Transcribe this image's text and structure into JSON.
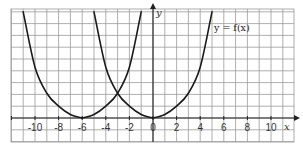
{
  "chart_data": {
    "type": "line",
    "title": "",
    "xlabel": "x",
    "ylabel": "y",
    "xlim": [
      -12,
      12
    ],
    "ylim": [
      -2,
      9.2
    ],
    "grid": true,
    "x_tick_labels": [
      "-10",
      "-8",
      "-6",
      "-4",
      "-2",
      "0",
      "2",
      "4",
      "6",
      "8",
      "10"
    ],
    "annotations": [
      {
        "text": "y = f(x)",
        "x": 5.2,
        "y": 8.2
      }
    ],
    "series": [
      {
        "name": "y = f(x)",
        "x": [
          0,
          1,
          2,
          3,
          4,
          5
        ],
        "y": [
          0,
          0.3,
          1,
          2.1,
          4.3,
          9
        ]
      },
      {
        "name": "reflection of f in y-axis",
        "x": [
          -5,
          -4,
          -3,
          -2,
          -1,
          0
        ],
        "y": [
          9,
          4.3,
          2.1,
          1,
          0.3,
          0
        ]
      },
      {
        "name": "translated curve (vertex at -6), right branch",
        "x": [
          -6,
          -5,
          -4,
          -3,
          -2,
          -1
        ],
        "y": [
          0,
          0.3,
          1,
          2.1,
          4.3,
          9
        ]
      },
      {
        "name": "translated curve (vertex at -6), left branch",
        "x": [
          -11,
          -10,
          -9,
          -8,
          -7,
          -6
        ],
        "y": [
          9,
          4.3,
          2.1,
          1,
          0.3,
          0
        ]
      }
    ]
  },
  "labels": {
    "x_axis": "x",
    "y_axis": "y",
    "curve": "y = f(x)"
  }
}
